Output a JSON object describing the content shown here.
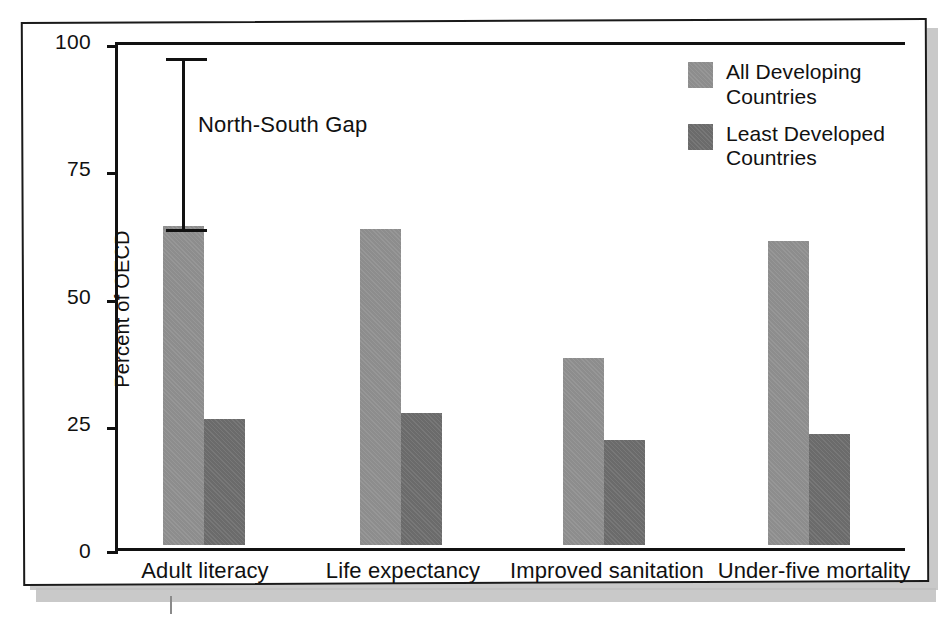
{
  "chart_data": {
    "type": "bar",
    "title": "",
    "xlabel": "",
    "ylabel": "Percent of OECD",
    "ylim": [
      0,
      100
    ],
    "yticks": [
      0,
      25,
      50,
      75,
      100
    ],
    "ytick_labels": [
      "0",
      "25",
      "50",
      "75",
      "100"
    ],
    "grid": false,
    "legend_position": "top-right",
    "categories": [
      "Adult literacy",
      "Life expectancy",
      "Improved sanitation",
      "Under-five mortality"
    ],
    "series": [
      {
        "name": "All Developing Countries",
        "color": "#8d8d8d",
        "values": [
          63,
          62.5,
          37,
          60
        ]
      },
      {
        "name": "Least Developed Countries",
        "color": "#6b6b6b",
        "values": [
          25,
          26,
          20.7,
          22
        ]
      }
    ],
    "annotations": [
      {
        "name": "north-south-gap",
        "label": "North-South Gap",
        "category": "Adult literacy",
        "type": "error-bar",
        "from": 63,
        "to": 97.5
      }
    ]
  },
  "legend": {
    "items": [
      {
        "label": "All Developing\nCountries",
        "swatch": "light"
      },
      {
        "label": "Least Developed\nCountries",
        "swatch": "dark"
      }
    ]
  },
  "axis": {
    "y_title": "Percent of OECD",
    "y_labels": [
      "100",
      "75",
      "50",
      "25",
      "0"
    ]
  },
  "colors": {
    "series_all_developing": "#8d8d8d",
    "series_least_developed": "#6b6b6b",
    "axis": "#111111",
    "frame": "#1a1a1a",
    "page_shadow": "#c9c9c9"
  }
}
